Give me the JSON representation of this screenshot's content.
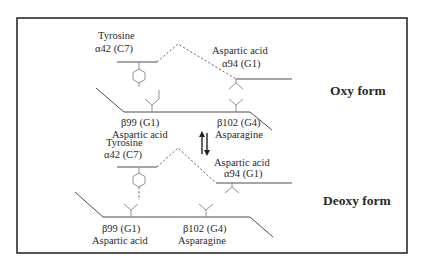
{
  "figure": {
    "type": "hemoglobin alpha1-beta2 contact diagram",
    "forms": {
      "oxy": {
        "label": "Oxy form",
        "alpha_residue_1": {
          "name": "Tyrosine",
          "position": "α42 (C7)"
        },
        "alpha_residue_2": {
          "name": "Aspartic acid",
          "position": "α94 (G1)"
        },
        "beta_residue_1": {
          "position": "β99 (G1)",
          "name": "Aspartic acid"
        },
        "beta_residue_2": {
          "position": "β102 (G4)",
          "name": "Asparagine"
        }
      },
      "deoxy": {
        "label": "Deoxy form",
        "alpha_residue_1": {
          "name": "Tyrosine",
          "position": "α42 (C7)"
        },
        "alpha_residue_2": {
          "name": "Aspartic acid",
          "position": "α94 (G1)"
        },
        "beta_residue_1": {
          "position": "β99 (G1)",
          "name": "Aspartic acid"
        },
        "beta_residue_2": {
          "position": "β102 (G4)",
          "name": "Asparagine"
        }
      }
    },
    "equilibrium_arrow": "⇅",
    "colors": {
      "line": "#3a3a3a",
      "text": "#2a2a2a",
      "frame": "#2b2b2b",
      "background": "#ffffff"
    }
  }
}
